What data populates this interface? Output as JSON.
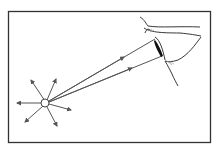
{
  "diagram": {
    "colors": {
      "background": "#ffffff",
      "frame": "#333333",
      "ray": "#555555",
      "eye_outline": "#222222",
      "pupil": "#111111"
    },
    "elements": {
      "frame": "border",
      "source": "point-light-source",
      "rays_outward": 7,
      "rays_to_eye": 2,
      "eye": "human-eye-side-view"
    }
  }
}
